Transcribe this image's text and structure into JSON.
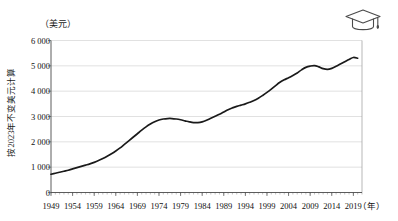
{
  "figure": {
    "icon": "graduation-cap-icon",
    "unit_label": "（美元）",
    "y_axis_title": "按2023年不变美元计算",
    "x_axis_unit": "（年）"
  },
  "chart_data": {
    "type": "line",
    "title": "",
    "subtitle": "",
    "xlabel": "（年）",
    "ylabel": "按2023年不变美元计算",
    "unit": "（美元）",
    "grid": true,
    "legend": false,
    "xlim": [
      1949,
      2021
    ],
    "ylim": [
      0,
      6000
    ],
    "yticks": [
      0,
      1000,
      2000,
      3000,
      4000,
      5000,
      6000
    ],
    "ytick_labels": [
      "0",
      "1 000",
      "2 000",
      "3 000",
      "4 000",
      "5 000",
      "6 000"
    ],
    "xticks": [
      1949,
      1954,
      1959,
      1964,
      1969,
      1974,
      1979,
      1984,
      1989,
      1994,
      1999,
      2004,
      2009,
      2014,
      2019
    ],
    "xtick_labels": [
      "1949",
      "1954",
      "1959",
      "1964",
      "1969",
      "1974",
      "1979",
      "1984",
      "1989",
      "1994",
      "1999",
      "2004",
      "2009",
      "2014",
      "2019"
    ],
    "x_minor_tick_interval": 1,
    "series": [
      {
        "name": "人均教育支出",
        "color": "#1a1a1a",
        "x": [
          1949,
          1950,
          1951,
          1952,
          1953,
          1954,
          1955,
          1956,
          1957,
          1958,
          1959,
          1960,
          1961,
          1962,
          1963,
          1964,
          1965,
          1966,
          1967,
          1968,
          1969,
          1970,
          1971,
          1972,
          1973,
          1974,
          1975,
          1976,
          1977,
          1978,
          1979,
          1980,
          1981,
          1982,
          1983,
          1984,
          1985,
          1986,
          1987,
          1988,
          1989,
          1990,
          1991,
          1992,
          1993,
          1994,
          1995,
          1996,
          1997,
          1998,
          1999,
          2000,
          2001,
          2002,
          2003,
          2004,
          2005,
          2006,
          2007,
          2008,
          2009,
          2010,
          2011,
          2012,
          2013,
          2014,
          2015,
          2016,
          2017,
          2018,
          2019,
          2020
        ],
        "y": [
          720,
          760,
          800,
          840,
          880,
          930,
          980,
          1030,
          1080,
          1130,
          1190,
          1260,
          1340,
          1430,
          1530,
          1640,
          1760,
          1900,
          2040,
          2180,
          2320,
          2460,
          2590,
          2700,
          2790,
          2860,
          2900,
          2920,
          2920,
          2900,
          2870,
          2830,
          2790,
          2760,
          2760,
          2790,
          2850,
          2930,
          3010,
          3090,
          3180,
          3270,
          3340,
          3400,
          3450,
          3500,
          3560,
          3630,
          3720,
          3830,
          3950,
          4080,
          4220,
          4350,
          4450,
          4530,
          4620,
          4720,
          4840,
          4940,
          4990,
          5010,
          4960,
          4890,
          4860,
          4900,
          4980,
          5070,
          5160,
          5250,
          5330,
          5300
        ]
      }
    ]
  }
}
